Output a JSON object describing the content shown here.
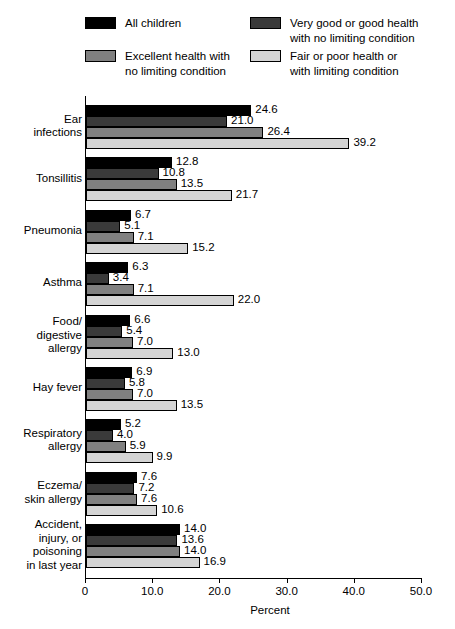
{
  "legend": {
    "items": [
      {
        "label": "All children",
        "color": "#000000",
        "position": "top-left"
      },
      {
        "label": "Very good or good health\nwith no limiting condition",
        "color": "#3a3a3a",
        "position": "top-right"
      },
      {
        "label": "Excellent health with\nno limiting condition",
        "color": "#808080",
        "position": "bottom-left"
      },
      {
        "label": "Fair or poor health or\nwith limiting condition",
        "color": "#d4d4d4",
        "position": "bottom-right"
      }
    ]
  },
  "chart_data": {
    "type": "bar",
    "orientation": "horizontal",
    "title": "",
    "xlabel": "Percent",
    "ylabel": "",
    "xlim": [
      0,
      50
    ],
    "xticks": [
      0,
      10,
      20,
      30,
      40,
      50
    ],
    "xticklabels": [
      "0",
      "10.0",
      "20.0",
      "30.0",
      "40.0",
      "50.0"
    ],
    "grid": false,
    "legend_position": "top",
    "categories": [
      "Ear\ninfections",
      "Tonsillitis",
      "Pneumonia",
      "Asthma",
      "Food/\ndigestive\nallergy",
      "Hay fever",
      "Respiratory\nallergy",
      "Eczema/\nskin allergy",
      "Accident,\ninjury, or\npoisoning\nin last year"
    ],
    "series": [
      {
        "name": "All children",
        "color": "#000000",
        "values": [
          24.6,
          12.8,
          6.7,
          6.3,
          6.6,
          6.9,
          5.2,
          7.6,
          14.0
        ],
        "labels": [
          "24.6",
          "12.8",
          "6.7",
          "6.3",
          "6.6",
          "6.9",
          "5.2",
          "7.6",
          "14.0"
        ]
      },
      {
        "name": "Very good or good health with no limiting condition",
        "color": "#3a3a3a",
        "values": [
          21.0,
          10.8,
          5.1,
          3.4,
          5.4,
          5.8,
          4.0,
          7.2,
          13.6
        ],
        "labels": [
          "21.0",
          "10.8",
          "5.1",
          "3.4",
          "5.4",
          "5.8",
          "4.0",
          "7.2",
          "13.6"
        ]
      },
      {
        "name": "Excellent health with no limiting condition",
        "color": "#808080",
        "values": [
          26.4,
          13.5,
          7.1,
          7.1,
          7.0,
          7.0,
          5.9,
          7.6,
          14.0
        ],
        "labels": [
          "26.4",
          "13.5",
          "7.1",
          "7.1",
          "7.0",
          "7.0",
          "5.9",
          "7.6",
          "14.0"
        ]
      },
      {
        "name": "Fair or poor health or with limiting condition",
        "color": "#d4d4d4",
        "values": [
          39.2,
          21.7,
          15.2,
          22.0,
          13.0,
          13.5,
          9.9,
          10.6,
          16.9
        ],
        "labels": [
          "39.2",
          "21.7",
          "15.2",
          "22.0",
          "13.0",
          "13.5",
          "9.9",
          "10.6",
          "16.9"
        ]
      }
    ]
  }
}
